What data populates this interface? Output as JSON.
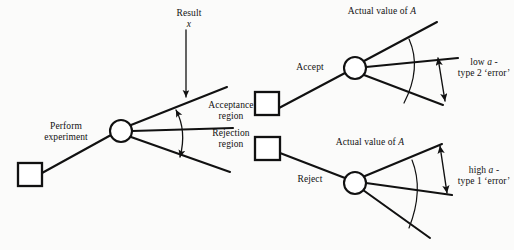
{
  "figure": {
    "background_color": "#fbfbfa",
    "stroke_color": "#111111",
    "node_fill": "#ffffff"
  },
  "labels": {
    "result": "Result",
    "result_variable": "x",
    "perform_experiment_line1": "Perform",
    "perform_experiment_line2": "experiment",
    "acceptance_region_line1": "Acceptance",
    "acceptance_region_line2": "region",
    "rejection_region_line1": "Rejection",
    "rejection_region_line2": "region",
    "actual_value_top": "Actual value of ",
    "actual_value_top_var": "A",
    "accept": "Accept",
    "low_alpha_line1_pre": "low ",
    "low_alpha_line1_var": "a",
    "low_alpha_line1_post": " -",
    "low_alpha_line2": "type 2 ‘error’",
    "actual_value_bottom": "Actual value of ",
    "actual_value_bottom_var": "A",
    "reject": "Reject",
    "high_alpha_line1_pre": "high ",
    "high_alpha_line1_var": "a",
    "high_alpha_line1_post": " -",
    "high_alpha_line2": "type 1 ‘error’"
  },
  "nodes": {
    "decision_square_left": {
      "x": 18,
      "y": 163,
      "size": 24
    },
    "chance_circle_left": {
      "cx": 121,
      "cy": 131,
      "r": 11
    },
    "decision_square_accept": {
      "x": 255,
      "y": 92,
      "size": 24
    },
    "chance_circle_accept": {
      "cx": 355,
      "cy": 68,
      "r": 11
    },
    "decision_square_reject": {
      "x": 255,
      "y": 137,
      "size": 24
    },
    "chance_circle_reject": {
      "cx": 355,
      "cy": 183,
      "r": 11
    }
  },
  "arrows": {
    "result_arrow": {
      "x": 186,
      "y1": 30,
      "y2": 97
    },
    "acceptance_span_arrow": "double-headed curved arrow spanning the upper fan of the left chance node",
    "low_alpha_span_arrow": "double-headed straight arrow spanning the lower gap of the accept branch fan",
    "high_alpha_span_arrow": "double-headed straight arrow spanning the upper gap of the reject branch fan"
  }
}
